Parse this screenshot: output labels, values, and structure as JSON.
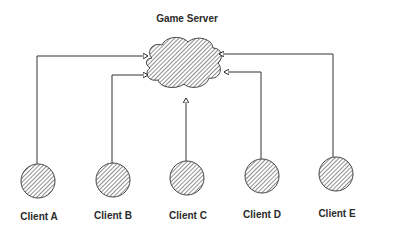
{
  "diagram": {
    "title": "Game Server",
    "server": {
      "shape": "cloud",
      "fill": "hatched",
      "label": "Game Server"
    },
    "clients": [
      {
        "id": "A",
        "label": "Client A"
      },
      {
        "id": "B",
        "label": "Client B"
      },
      {
        "id": "C",
        "label": "Client C"
      },
      {
        "id": "D",
        "label": "Client D"
      },
      {
        "id": "E",
        "label": "Client E"
      }
    ],
    "edges": [
      {
        "from": "Client A",
        "to": "Game Server"
      },
      {
        "from": "Client B",
        "to": "Game Server"
      },
      {
        "from": "Client C",
        "to": "Game Server"
      },
      {
        "from": "Client D",
        "to": "Game Server"
      },
      {
        "from": "Client E",
        "to": "Game Server"
      }
    ],
    "colors": {
      "stroke": "#333333",
      "hatch": "#444444",
      "background": "#ffffff"
    }
  }
}
